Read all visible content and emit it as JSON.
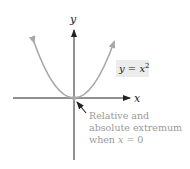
{
  "figure": {
    "axes": {
      "x_label": "x",
      "y_label": "y"
    },
    "curve": {
      "label_var": "y",
      "label_eq": " = ",
      "label_base": "x",
      "label_exp": "2",
      "color": "#a8a8a8",
      "label_bg": "#ececec"
    },
    "annotation": {
      "line1": "Relative and",
      "line2": "absolute extremum",
      "line3_prefix": "when ",
      "line3_var": "x",
      "line3_suffix": " = 0",
      "color": "#9a9a9a"
    }
  }
}
